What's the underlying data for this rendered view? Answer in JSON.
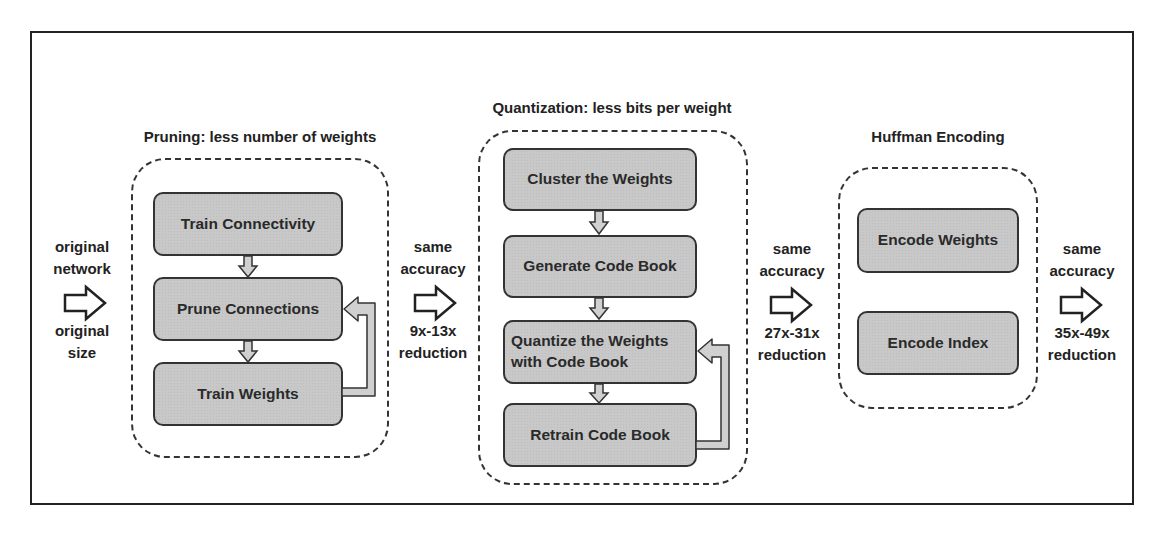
{
  "diagram": {
    "stages": [
      {
        "title": "Pruning: less number of weights",
        "steps": [
          "Train Connectivity",
          "Prune Connections",
          "Train Weights"
        ],
        "loop": {
          "from": "Train Weights",
          "to": "Prune Connections"
        }
      },
      {
        "title": "Quantization: less bits per weight",
        "steps": [
          "Cluster the Weights",
          "Generate Code Book",
          "Quantize the Weights\nwith Code Book",
          "Retrain Code Book"
        ],
        "loop": {
          "from": "Retrain Code Book",
          "to": "Quantize the Weights with Code Book"
        }
      },
      {
        "title": "Huffman Encoding",
        "steps": [
          "Encode Weights",
          "Encode Index"
        ]
      }
    ],
    "transitions": [
      {
        "top1": "original",
        "top2": "network",
        "bottom1": "original",
        "bottom2": "size"
      },
      {
        "top1": "same",
        "top2": "accuracy",
        "bottom1": "9x-13x",
        "bottom2": "reduction"
      },
      {
        "top1": "same",
        "top2": "accuracy",
        "bottom1": "27x-31x",
        "bottom2": "reduction"
      },
      {
        "top1": "same",
        "top2": "accuracy",
        "bottom1": "35x-49x",
        "bottom2": "reduction"
      }
    ]
  },
  "colors": {
    "box_fill": "#c8c8c8",
    "stroke": "#333333",
    "arrow_fill": "#d0d0d0"
  }
}
